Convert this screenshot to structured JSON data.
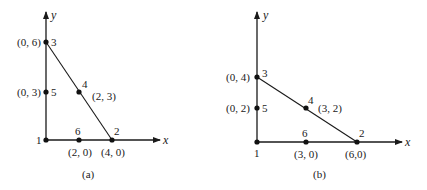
{
  "diagrams": [
    {
      "id": "a",
      "caption": "(a)",
      "axes": {
        "x_label": "x",
        "y_label": "y"
      },
      "nodes": [
        {
          "id": "1",
          "number": "1",
          "coord_label": "",
          "x": 0,
          "y": 0
        },
        {
          "id": "2",
          "number": "2",
          "coord_label": "(4, 0)",
          "x": 4,
          "y": 0
        },
        {
          "id": "3",
          "number": "3",
          "coord_label": "(0, 6)",
          "x": 0,
          "y": 6
        },
        {
          "id": "4",
          "number": "4",
          "coord_label": "(2, 3)",
          "x": 2,
          "y": 3
        },
        {
          "id": "5",
          "number": "5",
          "coord_label": "(0, 3)",
          "x": 0,
          "y": 3
        },
        {
          "id": "6",
          "number": "6",
          "coord_label": "(2, 0)",
          "x": 2,
          "y": 0
        }
      ],
      "edges": [
        [
          "1",
          "2"
        ],
        [
          "2",
          "3"
        ],
        [
          "3",
          "1"
        ]
      ]
    },
    {
      "id": "b",
      "caption": "(b)",
      "axes": {
        "x_label": "x",
        "y_label": "y"
      },
      "nodes": [
        {
          "id": "1",
          "number": "1",
          "coord_label": "",
          "x": 0,
          "y": 0
        },
        {
          "id": "2",
          "number": "2",
          "coord_label": "(6,0)",
          "x": 6,
          "y": 0
        },
        {
          "id": "3",
          "number": "3",
          "coord_label": "(0, 4)",
          "x": 0,
          "y": 4
        },
        {
          "id": "4",
          "number": "4",
          "coord_label": "(3, 2)",
          "x": 3,
          "y": 2
        },
        {
          "id": "5",
          "number": "5",
          "coord_label": "(0, 2)",
          "x": 0,
          "y": 2
        },
        {
          "id": "6",
          "number": "6",
          "coord_label": "(3, 0)",
          "x": 3,
          "y": 0
        }
      ],
      "edges": [
        [
          "1",
          "2"
        ],
        [
          "2",
          "3"
        ],
        [
          "3",
          "1"
        ]
      ]
    }
  ]
}
